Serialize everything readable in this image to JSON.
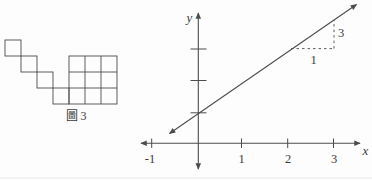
{
  "colors": {
    "ink": "#4c4c4c",
    "text": "#3a3a3a",
    "background": "#fdfdfd"
  },
  "left_figure": {
    "caption": "圖 3",
    "staircase_square_count": 4,
    "grid_rows": 3,
    "grid_cols": 3
  },
  "right_figure": {
    "type": "coordinate-plane-line",
    "axis_labels": {
      "x": "x",
      "y": "y"
    },
    "x_tick_labels": [
      "-1",
      "1",
      "2",
      "3"
    ],
    "y_unlabeled_tick_count": 3,
    "line": {
      "x_intercept_label": "-1",
      "slope_rise_label": "3",
      "slope_run_label": "1"
    }
  }
}
